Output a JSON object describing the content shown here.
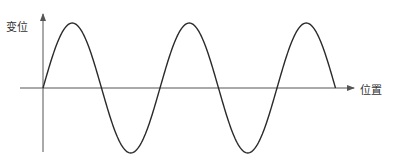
{
  "diagram": {
    "type": "sine-wave-graph",
    "y_axis_label": "变位",
    "x_axis_label": "位置",
    "colors": {
      "curve": "#2a2a2a",
      "axis": "#555555",
      "label": "#333333",
      "background": "#ffffff"
    }
  },
  "chart_data": {
    "type": "line",
    "title": "",
    "xlabel": "位置",
    "ylabel": "变位",
    "function": "y = sin(x)",
    "cycles": 2.5,
    "x": [
      0,
      0.25,
      0.5,
      0.75,
      1.0,
      1.25,
      1.5,
      1.75,
      2.0,
      2.25,
      2.5
    ],
    "values": [
      0,
      1,
      0,
      -1,
      0,
      1,
      0,
      -1,
      0,
      1,
      0
    ],
    "x_unit": "period",
    "ylim": [
      -1,
      1
    ],
    "grid": false,
    "legend": "none"
  }
}
